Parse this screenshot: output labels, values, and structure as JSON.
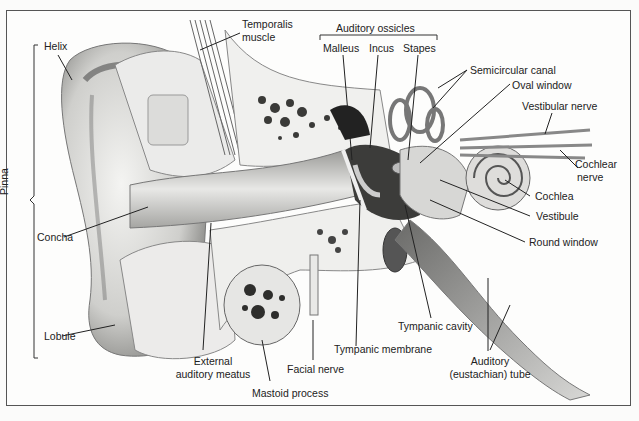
{
  "diagram": {
    "group_labels": {
      "pinna": "Pinna",
      "auditory_ossicles": "Auditory ossicles"
    },
    "labels": {
      "helix": "Helix",
      "temporalis_muscle_1": "Temporalis",
      "temporalis_muscle_2": "muscle",
      "malleus": "Malleus",
      "incus": "Incus",
      "stapes": "Stapes",
      "semicircular_canal": "Semicircular canal",
      "oval_window": "Oval window",
      "vestibular_nerve": "Vestibular nerve",
      "cochlear_nerve_1": "Cochlear",
      "cochlear_nerve_2": "nerve",
      "cochlea": "Cochlea",
      "vestibule": "Vestibule",
      "round_window": "Round window",
      "concha": "Concha",
      "lobule": "Lobule",
      "external_auditory_meatus_1": "External",
      "external_auditory_meatus_2": "auditory meatus",
      "mastoid_process": "Mastoid process",
      "facial_nerve": "Facial nerve",
      "tympanic_membrane": "Tympanic membrane",
      "tympanic_cavity": "Tympanic cavity",
      "auditory_tube_1": "Auditory",
      "auditory_tube_2": "(eustachian) tube"
    }
  }
}
